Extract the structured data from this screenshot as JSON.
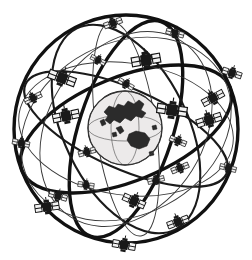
{
  "figure": {
    "style": "black and white line art illustration",
    "background_color": "#ffffff",
    "line_color": "#111111",
    "earth_fill_color": "#eceaea",
    "landmass_color": "#2b2b2b",
    "satellite_body_color": "#191919",
    "satellite_panel_color": "#f2f2f2",
    "width": 252,
    "height": 260
  },
  "earth": {
    "label": "earth-globe",
    "center_x": 125,
    "center_y": 128,
    "radius": 37,
    "visible_regions": [
      "Asia",
      "Southeast Asia",
      "Australia",
      "Indonesia"
    ]
  },
  "constellation": {
    "satellite_count": 24,
    "orbit_count": 9,
    "orbits": [
      {
        "name": "sphere-outline",
        "weight": "thick",
        "cx": 126,
        "cy": 129,
        "rx": 112,
        "ry": 114,
        "rotation": 0
      },
      {
        "name": "orbit-plane-1",
        "weight": "thick",
        "cx": 126,
        "cy": 129,
        "rx": 112,
        "ry": 52,
        "rotation": -22
      },
      {
        "name": "orbit-plane-2",
        "weight": "thick",
        "cx": 126,
        "cy": 129,
        "rx": 47,
        "ry": 113,
        "rotation": 18
      },
      {
        "name": "orbit-plane-3",
        "weight": "med",
        "cx": 126,
        "cy": 129,
        "rx": 110,
        "ry": 40,
        "rotation": 24
      },
      {
        "name": "orbit-plane-4",
        "weight": "med",
        "cx": 126,
        "cy": 129,
        "rx": 62,
        "ry": 112,
        "rotation": -26
      },
      {
        "name": "orbit-plane-5",
        "weight": "thin",
        "cx": 126,
        "cy": 129,
        "rx": 108,
        "ry": 66,
        "rotation": 8
      },
      {
        "name": "orbit-plane-6",
        "weight": "thin",
        "cx": 126,
        "cy": 129,
        "rx": 86,
        "ry": 110,
        "rotation": 62
      },
      {
        "name": "orbit-plane-7",
        "weight": "thin",
        "cx": 126,
        "cy": 129,
        "rx": 104,
        "ry": 78,
        "rotation": -58
      },
      {
        "name": "orbit-plane-8",
        "weight": "thin",
        "cx": 126,
        "cy": 129,
        "rx": 30,
        "ry": 108,
        "rotation": -8
      }
    ],
    "satellites": [
      {
        "id": 1,
        "x": 113,
        "y": 23,
        "angle": -20,
        "scale": 0.8
      },
      {
        "id": 2,
        "x": 175,
        "y": 33,
        "angle": 15,
        "scale": 0.78
      },
      {
        "id": 3,
        "x": 146,
        "y": 60,
        "angle": -10,
        "scale": 1.25
      },
      {
        "id": 4,
        "x": 62,
        "y": 78,
        "angle": 20,
        "scale": 1.2
      },
      {
        "id": 5,
        "x": 33,
        "y": 98,
        "angle": -25,
        "scale": 0.78
      },
      {
        "id": 6,
        "x": 232,
        "y": 73,
        "angle": 18,
        "scale": 0.85
      },
      {
        "id": 7,
        "x": 66,
        "y": 116,
        "angle": -12,
        "scale": 1.15
      },
      {
        "id": 8,
        "x": 172,
        "y": 110,
        "angle": 8,
        "scale": 1.3
      },
      {
        "id": 9,
        "x": 126,
        "y": 84,
        "angle": 30,
        "scale": 0.72
      },
      {
        "id": 10,
        "x": 209,
        "y": 120,
        "angle": -18,
        "scale": 1.1
      },
      {
        "id": 11,
        "x": 21,
        "y": 143,
        "angle": 12,
        "scale": 0.75
      },
      {
        "id": 12,
        "x": 178,
        "y": 141,
        "angle": 22,
        "scale": 0.75
      },
      {
        "id": 13,
        "x": 87,
        "y": 152,
        "angle": -16,
        "scale": 0.75
      },
      {
        "id": 14,
        "x": 180,
        "y": 168,
        "angle": -22,
        "scale": 0.78
      },
      {
        "id": 15,
        "x": 228,
        "y": 168,
        "angle": 14,
        "scale": 0.72
      },
      {
        "id": 16,
        "x": 86,
        "y": 185,
        "angle": 8,
        "scale": 0.7
      },
      {
        "id": 17,
        "x": 156,
        "y": 180,
        "angle": -14,
        "scale": 0.72
      },
      {
        "id": 18,
        "x": 58,
        "y": 196,
        "angle": 16,
        "scale": 0.8
      },
      {
        "id": 19,
        "x": 47,
        "y": 207,
        "angle": -8,
        "scale": 1.05
      },
      {
        "id": 20,
        "x": 134,
        "y": 201,
        "angle": 24,
        "scale": 1.0
      },
      {
        "id": 21,
        "x": 178,
        "y": 222,
        "angle": -20,
        "scale": 0.95
      },
      {
        "id": 22,
        "x": 124,
        "y": 245,
        "angle": 10,
        "scale": 1.0
      },
      {
        "id": 23,
        "x": 213,
        "y": 98,
        "angle": -28,
        "scale": 1.0
      },
      {
        "id": 24,
        "x": 98,
        "y": 60,
        "angle": 26,
        "scale": 0.68
      }
    ]
  }
}
